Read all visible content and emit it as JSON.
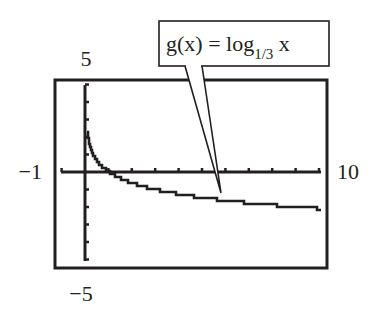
{
  "chart_data": {
    "type": "line",
    "title": "",
    "function_label": {
      "prefix": "g(x) = log",
      "subscript": "1/3",
      "suffix": " x"
    },
    "xlabel": "",
    "ylabel": "",
    "xlim": [
      -1,
      10
    ],
    "ylim": [
      -5,
      5
    ],
    "window_labels": {
      "xmin": "−1",
      "xmax": "10",
      "ymin": "−5",
      "ymax": "5"
    },
    "x_tick_step": 1,
    "y_tick_step": 1,
    "grid": false,
    "legend": "callout",
    "series": [
      {
        "name": "g(x) = log_{1/3} x",
        "x": [
          0.1,
          0.2,
          0.3,
          0.5,
          0.75,
          1,
          1.5,
          2,
          3,
          4,
          5,
          6,
          7,
          8,
          9,
          10
        ],
        "values": [
          2.096,
          1.465,
          1.096,
          0.631,
          0.262,
          0,
          -0.369,
          -0.631,
          -1,
          -1.262,
          -1.465,
          -1.631,
          -1.771,
          -1.893,
          -2,
          -2.096
        ]
      }
    ],
    "colors": {
      "ink": "#231f20",
      "background": "#ffffff"
    }
  }
}
